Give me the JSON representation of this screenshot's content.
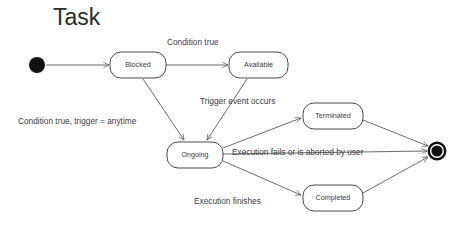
{
  "diagram": {
    "title": "Task",
    "type": "uml-state-machine",
    "background_color": "#ffffff",
    "line_color": "#5a5a5a",
    "text_color": "#3c3c3c",
    "states": [
      {
        "id": "initial",
        "kind": "initial-state",
        "label": "",
        "cx": 37,
        "cy": 65,
        "r": 8
      },
      {
        "id": "blocked",
        "kind": "state",
        "label": "Blocked",
        "x": 110,
        "y": 52,
        "w": 56,
        "h": 26
      },
      {
        "id": "available",
        "kind": "state",
        "label": "Available",
        "x": 229,
        "y": 52,
        "w": 59,
        "h": 26
      },
      {
        "id": "ongoing",
        "kind": "state",
        "label": "Ongoing",
        "x": 167,
        "y": 142,
        "w": 56,
        "h": 26
      },
      {
        "id": "terminated",
        "kind": "state",
        "label": "Terminated",
        "x": 303,
        "y": 103,
        "w": 60,
        "h": 26
      },
      {
        "id": "completed",
        "kind": "state",
        "label": "Completed",
        "x": 303,
        "y": 185,
        "w": 60,
        "h": 26
      },
      {
        "id": "final",
        "kind": "final-state",
        "label": "",
        "cx": 437,
        "cy": 151,
        "r": 9
      }
    ],
    "transitions": [
      {
        "id": "t1",
        "from": "initial",
        "to": "blocked",
        "label": ""
      },
      {
        "id": "t2",
        "from": "blocked",
        "to": "available",
        "label": "Condition true"
      },
      {
        "id": "t3",
        "from": "blocked",
        "to": "ongoing",
        "label": "Condition true, trigger = anytime"
      },
      {
        "id": "t4",
        "from": "available",
        "to": "ongoing",
        "label": "Trigger event occurs"
      },
      {
        "id": "t5",
        "from": "ongoing",
        "to": "terminated",
        "label": ""
      },
      {
        "id": "t6",
        "from": "ongoing",
        "to": "final",
        "label": "Execution fails or is aborted by user"
      },
      {
        "id": "t7",
        "from": "ongoing",
        "to": "completed",
        "label": "Execution finishes"
      },
      {
        "id": "t8",
        "from": "terminated",
        "to": "final",
        "label": ""
      },
      {
        "id": "t9",
        "from": "completed",
        "to": "final",
        "label": ""
      }
    ],
    "labels": {
      "condition_true": "Condition true",
      "condition_true_trigger_anytime": "Condition true, trigger = anytime",
      "trigger_event_occurs": "Trigger event occurs",
      "execution_fails": "Execution fails or is aborted by user",
      "execution_finishes": "Execution finishes"
    }
  }
}
